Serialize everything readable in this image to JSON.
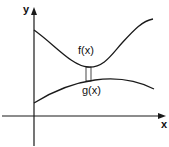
{
  "diagram": {
    "axes": {
      "x_label": "x",
      "y_label": "y"
    },
    "curves": [
      {
        "name": "f",
        "label": "f(x)",
        "shape": "upper curve, decreasing to a minimum then increasing"
      },
      {
        "name": "g",
        "label": "g(x)",
        "shape": "lower curve, increasing to a maximum then slightly decreasing"
      }
    ],
    "annotation": "thin vertical rectangle between g(x) and f(x) near minimum of f",
    "stroke_color": "#1a1a1a"
  }
}
